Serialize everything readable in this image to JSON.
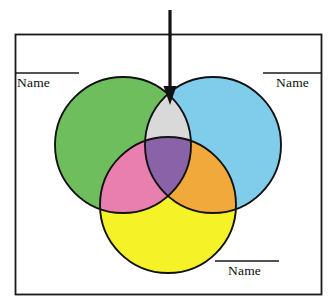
{
  "diagram": {
    "title_text": "",
    "type": "three-set-venn-diagram",
    "frame": {
      "name": "outer-border",
      "stroke_color": "#1a1a1a",
      "fill_color": "#ffffff",
      "x": 15,
      "y": 34,
      "width": 307,
      "height": 261
    },
    "sets": [
      {
        "id": "green-set",
        "position": "top-left",
        "color": "#6FBE5E",
        "label": "Name",
        "cx": 123,
        "cy": 145,
        "r": 68
      },
      {
        "id": "blue-set",
        "position": "top-right",
        "color": "#80CDEB",
        "label": "Name",
        "cx": 213,
        "cy": 145,
        "r": 68
      },
      {
        "id": "yellow-set",
        "position": "bottom-center",
        "color": "#F5F228",
        "label": "Name",
        "cx": 168,
        "cy": 205,
        "r": 68
      }
    ],
    "intersections": [
      {
        "id": "green-blue-lens",
        "sets": [
          "green-set",
          "blue-set"
        ],
        "color": "#D9D9D9",
        "description": "light gray lens, arrow target"
      },
      {
        "id": "green-yellow-lens",
        "sets": [
          "green-set",
          "yellow-set"
        ],
        "color": "#E87FAF",
        "description": "pink lens"
      },
      {
        "id": "blue-yellow-lens",
        "sets": [
          "blue-set",
          "yellow-set"
        ],
        "color": "#F2A93B",
        "description": "orange lens"
      },
      {
        "id": "center-triple",
        "sets": [
          "green-set",
          "blue-set",
          "yellow-set"
        ],
        "color": "#8A62A8",
        "description": "purple center"
      }
    ],
    "arrow": {
      "name": "pointer-arrow",
      "color": "#121212",
      "direction": "down",
      "x": 170,
      "y_start": 10,
      "y_end": 104,
      "points_to": "green-blue-lens"
    },
    "labels": {
      "left": {
        "text": "Name",
        "rule": {
          "x1": 16,
          "x2": 79,
          "y": 73
        }
      },
      "right": {
        "text": "Name",
        "rule": {
          "x1": 263,
          "x2": 321,
          "y": 73
        }
      },
      "bottom": {
        "text": "Name",
        "rule": {
          "x1": 215,
          "x2": 279,
          "y": 261
        }
      }
    },
    "colors": {
      "outline": "#121212",
      "background": "#ffffff",
      "rule_color": "#1a1a1a"
    }
  }
}
